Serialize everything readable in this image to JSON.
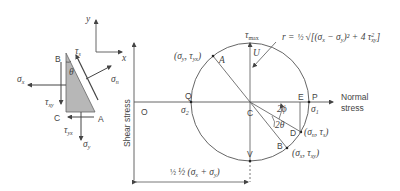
{
  "element": {
    "coord_axes": {
      "x": "x",
      "y": "y"
    },
    "corners": {
      "B": "B",
      "C": "C",
      "A": "A"
    },
    "angle": "θ",
    "stresses": {
      "sigma_x": "σ",
      "sigma_x_sub": "x",
      "tau_xy": "τ",
      "tau_xy_sub": "xy",
      "tau_yx": "τ",
      "tau_yx_sub": "yx",
      "sigma_y": "σ",
      "sigma_y_sub": "y",
      "sigma_n": "σ",
      "sigma_n_sub": "n",
      "tau_s": "τ",
      "tau_s_sub": "s"
    }
  },
  "axes": {
    "vertical_label": "Shear stress",
    "horizontal_label_line1": "Normal",
    "horizontal_label_line2": "stress",
    "origin": "O"
  },
  "circle": {
    "center": "C",
    "points": {
      "Q": "Q",
      "P": "P",
      "E": "E",
      "U": "U",
      "V": "V",
      "A": "A",
      "B": "B",
      "D": "D"
    },
    "labels": {
      "sigma2": "σ",
      "sigma2_sub": "2",
      "sigma1": "σ",
      "sigma1_sub": "1",
      "tau_max": "τ",
      "tau_max_sub": "max",
      "A_coords": "(σ",
      "A_coords_mid": "y",
      "A_coords_tau": ", τ",
      "A_coords_end": "yx",
      "B_coords": "(σ",
      "B_coords_mid": "x",
      "B_coords_tau": ", τ",
      "B_coords_end": "xy",
      "D_coords": "(σ",
      "D_coords_mid": "n",
      "D_coords_tau": ", τ",
      "D_coords_end": "s",
      "angle_2phi": "2ϕ",
      "angle_2theta": "2θ"
    },
    "radius_formula": "r = ½ √[(σx − σy)² + 4 τ²xy]",
    "radius_formula_parts": {
      "r": "r =",
      "half": "½",
      "root": "√[(σ",
      "sx": "x",
      "minus": " − σ",
      "sy": "y",
      "sq": ")² + 4 τ",
      "tsup": "2",
      "tsub": "xy",
      "close": "]"
    },
    "center_dimension": "½ (σ",
    "center_dimension_x": "x",
    "center_dimension_plus": " + σ",
    "center_dimension_y": "y",
    "center_dimension_close": ")"
  }
}
